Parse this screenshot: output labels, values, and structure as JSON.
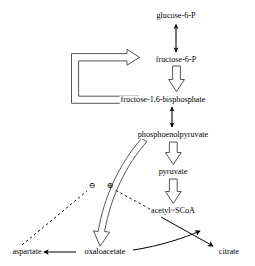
{
  "diagram": {
    "background_color": "#ffffff",
    "line_color": "#000000",
    "nodes": [
      {
        "id": "glucose6p",
        "label": "glucose-6-P",
        "x": 176,
        "y": 16
      },
      {
        "id": "fructose6p",
        "label": "fructose-6-P",
        "x": 176,
        "y": 60
      },
      {
        "id": "fbp",
        "label": "fructose-1,6-bisphosphate",
        "x": 163,
        "y": 100
      },
      {
        "id": "pep",
        "label": "phosphoenolpyruvate",
        "x": 173,
        "y": 135
      },
      {
        "id": "pyruvate",
        "label": "pyruvate",
        "x": 173,
        "y": 172
      },
      {
        "id": "acetylscoa",
        "label": "acetyl~SCoA",
        "x": 173,
        "y": 211
      },
      {
        "id": "aspartate",
        "label": "aspartate",
        "x": 27,
        "y": 252
      },
      {
        "id": "oxaloacetate",
        "label": "oxaloacetate",
        "x": 105,
        "y": 252
      },
      {
        "id": "citrate",
        "label": "citrate",
        "x": 229,
        "y": 252
      }
    ],
    "signs": [
      {
        "id": "inhibition",
        "symbol": "⊖",
        "meaning": "negative regulation",
        "x": 92,
        "y": 186
      },
      {
        "id": "activation",
        "symbol": "⊕",
        "meaning": "positive regulation",
        "x": 110,
        "y": 186
      }
    ],
    "edges": [
      {
        "id": "g6p-f6p",
        "from": "glucose-6-P",
        "to": "fructose-6-P",
        "style": "solid",
        "heads": "double"
      },
      {
        "id": "f6p-fbp",
        "from": "fructose-6-P",
        "to": "fructose-1,6-bisphosphate",
        "style": "hollow",
        "heads": "single"
      },
      {
        "id": "fbp-loop-f6p",
        "from": "fructose-1,6-bisphosphate",
        "to": "fructose-6-P",
        "style": "hollow-loop",
        "heads": "single"
      },
      {
        "id": "fbp-pep",
        "from": "fructose-1,6-bisphosphate",
        "to": "phosphoenolpyruvate",
        "style": "solid",
        "heads": "double"
      },
      {
        "id": "pep-pyruvate",
        "from": "phosphoenolpyruvate",
        "to": "pyruvate",
        "style": "hollow",
        "heads": "single"
      },
      {
        "id": "pyruvate-acetyl",
        "from": "pyruvate",
        "to": "acetyl~SCoA",
        "style": "hollow",
        "heads": "single"
      },
      {
        "id": "oaa-pep",
        "from": "phosphoenolpyruvate",
        "to": "oxaloacetate",
        "style": "hollow-curved",
        "heads": "single"
      },
      {
        "id": "oaa-aspartate",
        "from": "oxaloacetate",
        "to": "aspartate",
        "style": "solid",
        "heads": "single"
      },
      {
        "id": "acetyl-citrate",
        "from": "acetyl~SCoA",
        "to": "citrate",
        "style": "solid",
        "heads": "single"
      },
      {
        "id": "oaa-citrate",
        "from": "oxaloacetate",
        "to": "citrate",
        "style": "solid-curved",
        "heads": "single"
      },
      {
        "id": "aspartate-inhibit",
        "from": "aspartate",
        "to": "inhibition",
        "style": "dashed",
        "heads": "none"
      },
      {
        "id": "acetyl-activate",
        "from": "acetyl~SCoA",
        "to": "activation",
        "style": "dashed",
        "heads": "none"
      }
    ]
  }
}
